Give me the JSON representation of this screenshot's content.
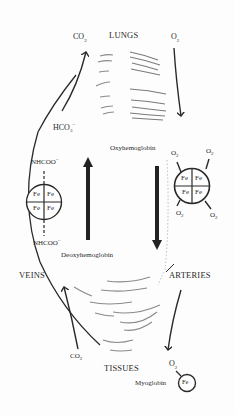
{
  "diagram": {
    "labels": {
      "lungs": "LUNGS",
      "tissues": "TISSUES",
      "veins": "VEINS",
      "arteries": "ARTERIES",
      "oxyhemoglobin": "Oxyhemoglobin",
      "deoxyhemoglobin": "Deoxyhemoglobin",
      "myoglobin": "Myoglobin",
      "co2_top": "CO",
      "co2_top_sub": "2",
      "o2_top": "O",
      "o2_top_sub": "2",
      "hco3": "HCO",
      "hco3_sub": "3",
      "hco3_sup": "−",
      "nhcoo_top": "NHCOO",
      "nhcoo_top_sup": "−",
      "nhcoo_bottom": "NHCOO",
      "nhcoo_bottom_sup": "−",
      "co2_bottom": "CO",
      "co2_bottom_sub": "2",
      "o2_bottom": "O",
      "o2_bottom_sub": "2",
      "fe": "Fe"
    },
    "deoxy_heme": {
      "cells": [
        "Fe",
        "Fe",
        "Fe",
        "Fe"
      ]
    },
    "oxy_heme": {
      "cells": [
        "Fe",
        "Fe",
        "Fe",
        "Fe"
      ],
      "ligands": [
        {
          "label": "O",
          "sub": "2"
        },
        {
          "label": "O",
          "sub": "2"
        },
        {
          "label": "O",
          "sub": "2"
        },
        {
          "label": "O",
          "sub": "2"
        }
      ]
    },
    "myoglobin_center": "Fe",
    "colors": {
      "ink": "#2a2a2a",
      "background": "#fdfdfd",
      "shading": "#8a8a8a"
    }
  }
}
